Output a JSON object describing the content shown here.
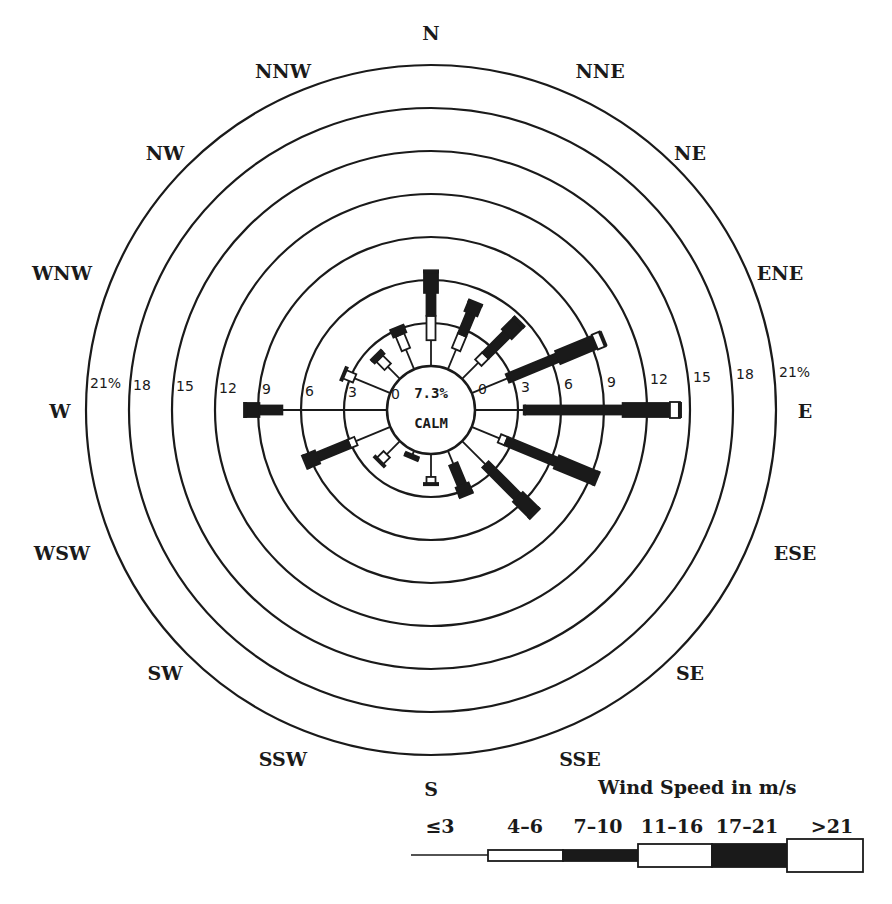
{
  "chart_data": {
    "type": "wind-rose",
    "title": "",
    "calm": {
      "value": "7.3%",
      "label": "CALM"
    },
    "directions": [
      "N",
      "NNE",
      "NE",
      "ENE",
      "E",
      "ESE",
      "SE",
      "SSE",
      "S",
      "SSW",
      "SW",
      "WSW",
      "W",
      "WNW",
      "NW",
      "NNW"
    ],
    "ring_labels_left": [
      "21%",
      "18",
      "15",
      "12",
      "9",
      "6",
      "3",
      "0"
    ],
    "ring_labels_right": [
      "0",
      "3",
      "6",
      "9",
      "12",
      "15",
      "18",
      "21%"
    ],
    "rings_percent": [
      0,
      3,
      6,
      9,
      12,
      15,
      18,
      21
    ],
    "legend": {
      "title": "Wind Speed in m/s",
      "categories": [
        "≤3",
        "4–6",
        "7–10",
        "11–16",
        "17–21",
        ">21"
      ],
      "styles": [
        "line",
        "narrow-white",
        "narrow-black",
        "wide-white",
        "wide-black",
        "widest-white"
      ]
    },
    "series_cumulative_percent": {
      "N": [
        1.8,
        3.5,
        5.1,
        5.1,
        6.6,
        6.6
      ],
      "NNE": [
        1.5,
        2.6,
        4.2,
        4.2,
        5.0,
        5.0
      ],
      "NE": [
        1.6,
        2.3,
        4.4,
        4.4,
        5.6,
        5.6
      ],
      "ENE": [
        2.7,
        2.8,
        6.5,
        6.5,
        9.3,
        9.9
      ],
      "E": [
        3.4,
        3.5,
        10.3,
        10.3,
        13.6,
        14.3
      ],
      "ESE": [
        2.1,
        2.6,
        6.4,
        6.4,
        9.4,
        9.4
      ],
      "SE": [
        2.3,
        2.3,
        5.5,
        5.5,
        7.1,
        7.1
      ],
      "SSE": [
        1.0,
        1.0,
        2.6,
        2.6,
        3.3,
        3.3
      ],
      "S": [
        1.6,
        2.1,
        2.1,
        2.1,
        2.1,
        2.1
      ],
      "SSW": [
        0.3,
        0.3,
        0.3,
        0.3,
        0.5,
        0.5
      ],
      "SW": [
        1.3,
        2.0,
        2.0,
        2.0,
        2.0,
        2.0
      ],
      "WSW": [
        2.6,
        3.1,
        5.5,
        5.5,
        6.4,
        6.4
      ],
      "W": [
        7.3,
        7.3,
        8.9,
        8.9,
        9.9,
        9.9
      ],
      "WNW": [
        2.7,
        3.5,
        3.5,
        3.5,
        3.5,
        3.5
      ],
      "NW": [
        1.2,
        2.0,
        2.0,
        2.0,
        2.3,
        2.3
      ],
      "NNW": [
        1.5,
        2.6,
        2.6,
        2.6,
        3.1,
        3.1
      ]
    },
    "xlabel": "",
    "ylabel": "",
    "legend_position": "bottom-right"
  }
}
